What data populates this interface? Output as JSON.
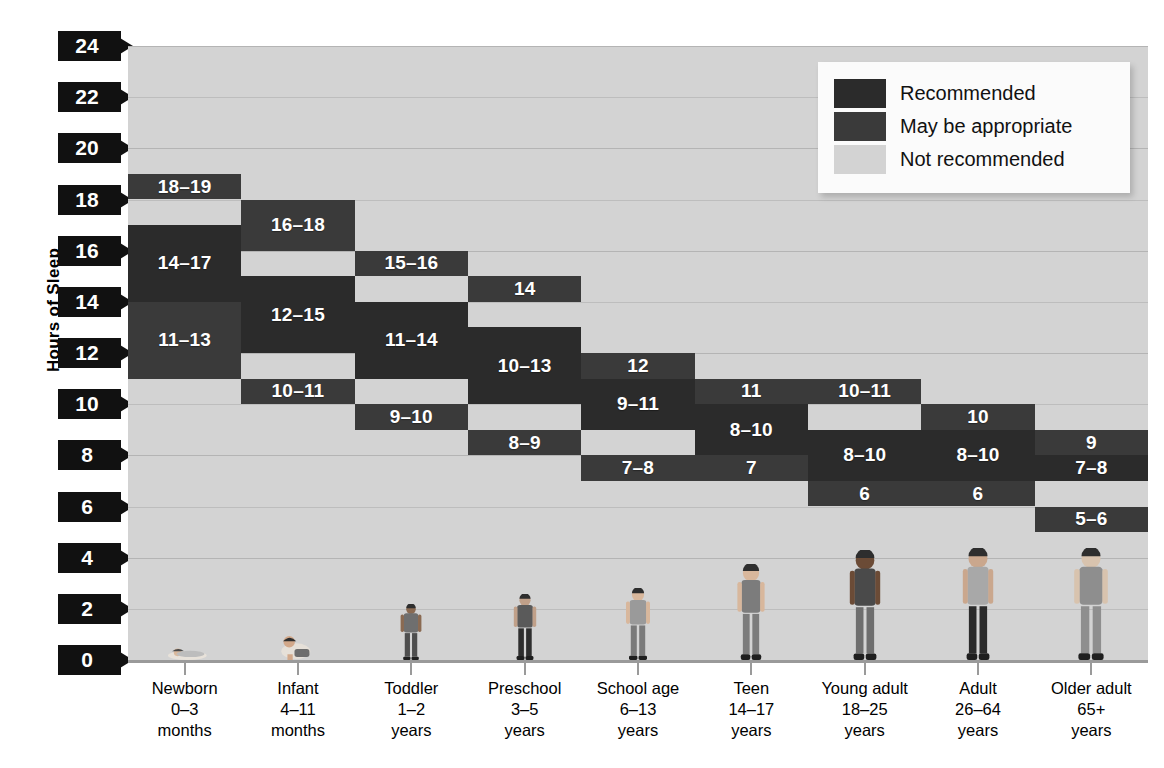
{
  "axis": {
    "y_title": "Hours of Sleep",
    "y_ticks": [
      "24",
      "22",
      "20",
      "18",
      "16",
      "14",
      "12",
      "10",
      "8",
      "6",
      "4",
      "2",
      "0"
    ]
  },
  "legend": {
    "items": [
      {
        "label": "Recommended",
        "color": "#2b2b2b",
        "swatch": "swatch-recommended"
      },
      {
        "label": "May be appropriate",
        "color": "#3a3a3a",
        "swatch": "swatch-may-be-appropriate"
      },
      {
        "label": "Not recommended",
        "color": "#d3d3d3",
        "swatch": "swatch-not-recommended"
      }
    ]
  },
  "categories": [
    {
      "name": "Newborn",
      "age": "0–3",
      "unit": "months"
    },
    {
      "name": "Infant",
      "age": "4–11",
      "unit": "months"
    },
    {
      "name": "Toddler",
      "age": "1–2",
      "unit": "years"
    },
    {
      "name": "Preschool",
      "age": "3–5",
      "unit": "years"
    },
    {
      "name": "School age",
      "age": "6–13",
      "unit": "years"
    },
    {
      "name": "Teen",
      "age": "14–17",
      "unit": "years"
    },
    {
      "name": "Young adult",
      "age": "18–25",
      "unit": "years"
    },
    {
      "name": "Adult",
      "age": "26–64",
      "unit": "years"
    },
    {
      "name": "Older adult",
      "age": "65+",
      "unit": "years"
    }
  ],
  "figures": [
    "sleeping-newborn-figure",
    "crawling-infant-figure",
    "toddler-figure",
    "preschool-child-figure",
    "school-age-child-figure",
    "teen-girl-figure",
    "young-adult-man-figure",
    "adult-woman-figure",
    "older-adult-man-figure"
  ],
  "chart_data": {
    "type": "bar",
    "title": "",
    "subtitle": "",
    "xlabel": "",
    "ylabel": "Hours of Sleep",
    "ylim": [
      0,
      24
    ],
    "ytick_step": 2,
    "grid": true,
    "legend_position": "top-right",
    "background_band": "Not recommended",
    "categories": [
      "Newborn 0–3 months",
      "Infant 4–11 months",
      "Toddler 1–2 years",
      "Preschool 3–5 years",
      "School age 6–13 years",
      "Teen 14–17 years",
      "Young adult 18–25 years",
      "Adult 26–64 years",
      "Older adult 65+ years"
    ],
    "series": [
      {
        "name": "May be appropriate (upper)",
        "color": "#3a3a3a",
        "ranges": [
          [
            18,
            19
          ],
          [
            16,
            18
          ],
          [
            15,
            16
          ],
          [
            14,
            15
          ],
          [
            11,
            12
          ],
          [
            10,
            11
          ],
          [
            10,
            11
          ],
          [
            9,
            10
          ],
          [
            8,
            9
          ]
        ],
        "labels": [
          "18–19",
          "16–18",
          "15–16",
          "14",
          "12",
          "11",
          "10–11",
          "10",
          "9"
        ]
      },
      {
        "name": "Recommended",
        "color": "#2b2b2b",
        "ranges": [
          [
            14,
            17
          ],
          [
            12,
            15
          ],
          [
            11,
            14
          ],
          [
            10,
            13
          ],
          [
            9,
            11
          ],
          [
            8,
            10
          ],
          [
            7,
            9
          ],
          [
            7,
            9
          ],
          [
            7,
            8
          ]
        ],
        "labels": [
          "14–17",
          "12–15",
          "11–14",
          "10–13",
          "9–11",
          "8–10",
          "8–10",
          "8–10",
          "7–8"
        ]
      },
      {
        "name": "May be appropriate (lower)",
        "color": "#3a3a3a",
        "ranges": [
          [
            11,
            14
          ],
          [
            10,
            11
          ],
          [
            9,
            10
          ],
          [
            8,
            9
          ],
          [
            7,
            8
          ],
          [
            7,
            8
          ],
          [
            6,
            7
          ],
          [
            6,
            7
          ],
          [
            5,
            6
          ]
        ],
        "labels": [
          "11–13",
          "10–11",
          "9–10",
          "8–9",
          "7–8",
          "7",
          "6",
          "6",
          "5–6"
        ]
      }
    ]
  }
}
